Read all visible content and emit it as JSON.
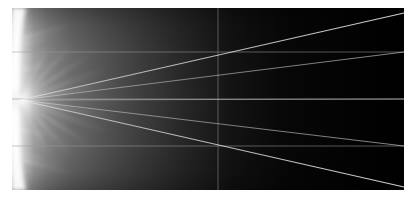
{
  "figure": {
    "type": "ray-trace-caustic-visualization",
    "background_color": "#ffffff",
    "canvas_color": "#000000",
    "canvas": {
      "x": 12,
      "y": 8,
      "width": 392,
      "height": 182
    }
  },
  "chart_data": {
    "type": "scatter",
    "title": "",
    "subtitle": "",
    "xlabel": "",
    "ylabel": "",
    "xlim": [
      0,
      392
    ],
    "ylim": [
      0,
      182
    ],
    "grid": true,
    "legend_position": "none",
    "tick_labels": {
      "x": [],
      "y": []
    },
    "annotations": [],
    "focus_point": {
      "x": 8,
      "y": 92
    },
    "background_field": {
      "description": "bright caustic glow concentrated at the left edge fading to black toward the right",
      "bright_color": "#f2f2f2",
      "mid_color": "#5a5a5a",
      "dark_color": "#000000",
      "glow_center_x": 8,
      "glow_center_y": 92,
      "falloff_end_x": 230
    },
    "grid_lines": {
      "color": "#9a9a9a",
      "horizontal_y": [
        44,
        91,
        138
      ],
      "vertical_x": [
        206
      ]
    },
    "series": [
      {
        "name": "ray-up-steep",
        "color": "#cfcfcf",
        "points": [
          {
            "x": 8,
            "y": 92
          },
          {
            "x": 392,
            "y": 5
          }
        ]
      },
      {
        "name": "ray-up-shallow",
        "color": "#b8b8b8",
        "points": [
          {
            "x": 8,
            "y": 92
          },
          {
            "x": 392,
            "y": 44
          }
        ]
      },
      {
        "name": "ray-axis",
        "color": "#9a9a9a",
        "points": [
          {
            "x": 8,
            "y": 92
          },
          {
            "x": 392,
            "y": 91
          }
        ]
      },
      {
        "name": "ray-down-shallow",
        "color": "#b8b8b8",
        "points": [
          {
            "x": 8,
            "y": 92
          },
          {
            "x": 392,
            "y": 138
          }
        ]
      },
      {
        "name": "ray-down-steep",
        "color": "#cfcfcf",
        "points": [
          {
            "x": 8,
            "y": 92
          },
          {
            "x": 392,
            "y": 179
          }
        ]
      }
    ],
    "caustic_streaks": [
      {
        "name": "streak-up-1",
        "angle_deg": -62,
        "length": 66,
        "color": "#e8e8e8"
      },
      {
        "name": "streak-up-2",
        "angle_deg": -47,
        "length": 78,
        "color": "#dcdcdc"
      },
      {
        "name": "streak-up-3",
        "angle_deg": -33,
        "length": 88,
        "color": "#d2d2d2"
      },
      {
        "name": "streak-up-4",
        "angle_deg": -20,
        "length": 96,
        "color": "#cacaca"
      },
      {
        "name": "streak-up-5",
        "angle_deg": -10,
        "length": 104,
        "color": "#c4c4c4"
      },
      {
        "name": "streak-flat",
        "angle_deg": 0,
        "length": 112,
        "color": "#e0e0e0"
      },
      {
        "name": "streak-down-5",
        "angle_deg": 10,
        "length": 104,
        "color": "#c4c4c4"
      },
      {
        "name": "streak-down-4",
        "angle_deg": 20,
        "length": 96,
        "color": "#cacaca"
      },
      {
        "name": "streak-down-3",
        "angle_deg": 33,
        "length": 88,
        "color": "#d2d2d2"
      },
      {
        "name": "streak-down-2",
        "angle_deg": 47,
        "length": 78,
        "color": "#dcdcdc"
      },
      {
        "name": "streak-down-1",
        "angle_deg": 62,
        "length": 66,
        "color": "#e8e8e8"
      }
    ]
  }
}
